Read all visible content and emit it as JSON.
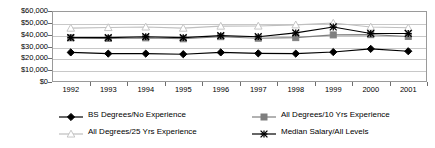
{
  "chart_data": {
    "type": "line",
    "title": "",
    "subtitle": "",
    "xlabel": "",
    "ylabel": "",
    "categories": [
      "1992",
      "1993",
      "1994",
      "1995",
      "1996",
      "1997",
      "1998",
      "1999",
      "2000",
      "2001"
    ],
    "x": [
      1992,
      1993,
      1994,
      1995,
      1996,
      1997,
      1998,
      1999,
      2000,
      2001
    ],
    "ylim": [
      0,
      60000
    ],
    "ytick_values": [
      0,
      10000,
      20000,
      30000,
      40000,
      50000,
      60000
    ],
    "ytick_labels": [
      "$0",
      "$10,000",
      "$20,000",
      "$30,000",
      "$40,000",
      "$50,000",
      "$60,000"
    ],
    "grid": true,
    "legend_position": "bottom",
    "series": [
      {
        "name": "BS Degrees/No Experience",
        "marker": "diamond-filled",
        "color": "#000000",
        "values": [
          25000,
          24000,
          24000,
          23500,
          25000,
          24200,
          24000,
          25300,
          28000,
          26000
        ]
      },
      {
        "name": "All Degrees/10 Yrs Experience",
        "marker": "square-filled",
        "color": "#7f7f7f",
        "values": [
          37300,
          36800,
          37300,
          36500,
          38300,
          37000,
          37500,
          39800,
          40000,
          38500
        ]
      },
      {
        "name": "All Degrees/25 Yrs Experience",
        "marker": "triangle-open",
        "color": "#bfbfbf",
        "values": [
          45500,
          46000,
          46500,
          45500,
          47200,
          47300,
          48300,
          49800,
          46500,
          45800
        ]
      },
      {
        "name": "Median Salary/All Levels",
        "marker": "star-x",
        "color": "#000000",
        "values": [
          37500,
          37500,
          38300,
          37500,
          39200,
          38300,
          41500,
          46500,
          41000,
          41000
        ]
      }
    ]
  },
  "legend": {
    "items": [
      {
        "label": "BS Degrees/No Experience",
        "marker": "diamond-filled",
        "color": "#000000"
      },
      {
        "label": "All Degrees/10 Yrs Experience",
        "marker": "square-filled",
        "color": "#7f7f7f"
      },
      {
        "label": "All Degrees/25 Yrs Experience",
        "marker": "triangle-open",
        "color": "#bfbfbf"
      },
      {
        "label": "Median Salary/All Levels",
        "marker": "star-x",
        "color": "#000000"
      }
    ]
  }
}
